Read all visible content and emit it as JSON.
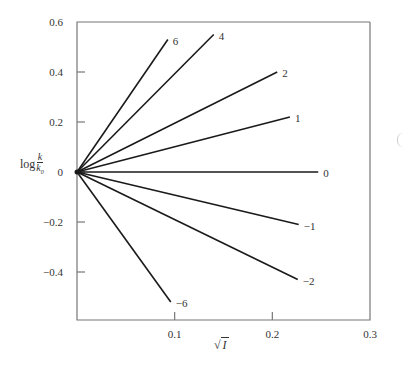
{
  "chart_data": {
    "type": "line",
    "title": "",
    "xlabel": "√I",
    "ylabel": "log k/k₀",
    "xlim": [
      0,
      0.3
    ],
    "ylim": [
      -0.6,
      0.6
    ],
    "x_ticks": [
      "0.1",
      "0.2",
      "0.3"
    ],
    "y_ticks": [
      "0.6",
      "0.4",
      "0.2",
      "0",
      "−0.2",
      "−0.4"
    ],
    "grid": false,
    "legend": "inline labels at line ends",
    "series": [
      {
        "name": "6",
        "x": [
          0,
          0.093
        ],
        "y": [
          0,
          0.53
        ]
      },
      {
        "name": "4",
        "x": [
          0,
          0.14
        ],
        "y": [
          0,
          0.55
        ]
      },
      {
        "name": "2",
        "x": [
          0,
          0.205
        ],
        "y": [
          0,
          0.4
        ]
      },
      {
        "name": "1",
        "x": [
          0,
          0.218
        ],
        "y": [
          0,
          0.22
        ]
      },
      {
        "name": "0",
        "x": [
          0,
          0.247
        ],
        "y": [
          0,
          0.0
        ]
      },
      {
        "name": "−1",
        "x": [
          0,
          0.227
        ],
        "y": [
          0,
          -0.21
        ]
      },
      {
        "name": "−2",
        "x": [
          0,
          0.226
        ],
        "y": [
          0,
          -0.43
        ]
      },
      {
        "name": "−6",
        "x": [
          0,
          0.096
        ],
        "y": [
          0,
          -0.52
        ]
      }
    ]
  },
  "axes": {
    "ylabel_prefix": "log",
    "ylabel_num": "k",
    "ylabel_den": "k",
    "ylabel_den_sub": "0",
    "xlabel_radical": "√",
    "xlabel_var": "I"
  }
}
